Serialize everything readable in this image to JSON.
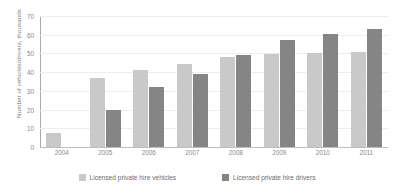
{
  "chart_data": {
    "type": "bar",
    "title": "",
    "xlabel": "",
    "ylabel": "Number of vehicles/drivers, thousands",
    "categories": [
      "2004",
      "2005",
      "2006",
      "2007",
      "2008",
      "2009",
      "2010",
      "2011"
    ],
    "series": [
      {
        "name": "Licensed private hire vehicles",
        "color": "#c9c9c9",
        "values": [
          7.5,
          37,
          41,
          44.5,
          48,
          49.5,
          50,
          51
        ]
      },
      {
        "name": "Licensed private hire drivers",
        "color": "#858585",
        "values": [
          0,
          20,
          32,
          39,
          49,
          57,
          60.5,
          63
        ]
      }
    ],
    "ylim": [
      0,
      70
    ],
    "yticks": [
      0,
      10,
      20,
      30,
      40,
      50,
      60,
      70
    ],
    "grid": true,
    "legend_position": "bottom"
  },
  "legend": {
    "items": [
      {
        "label": "Licensed private hire vehicles",
        "swatch": "vehicles"
      },
      {
        "label": "Licensed private hire drivers",
        "swatch": "drivers"
      }
    ]
  }
}
